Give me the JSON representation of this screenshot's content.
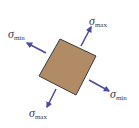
{
  "diagram": {
    "element": {
      "fill_color": "#b08b66",
      "edge_color": "#3d3a40",
      "rotation_deg": 25
    },
    "arrow_color": "#4d4c9c",
    "labels": [
      {
        "id": "top-right",
        "symbol": "σ",
        "subscript": "max"
      },
      {
        "id": "left",
        "symbol": "σ",
        "subscript": "min"
      },
      {
        "id": "right",
        "symbol": "σ",
        "subscript": "min"
      },
      {
        "id": "bottom",
        "symbol": "σ",
        "subscript": "max"
      }
    ]
  }
}
